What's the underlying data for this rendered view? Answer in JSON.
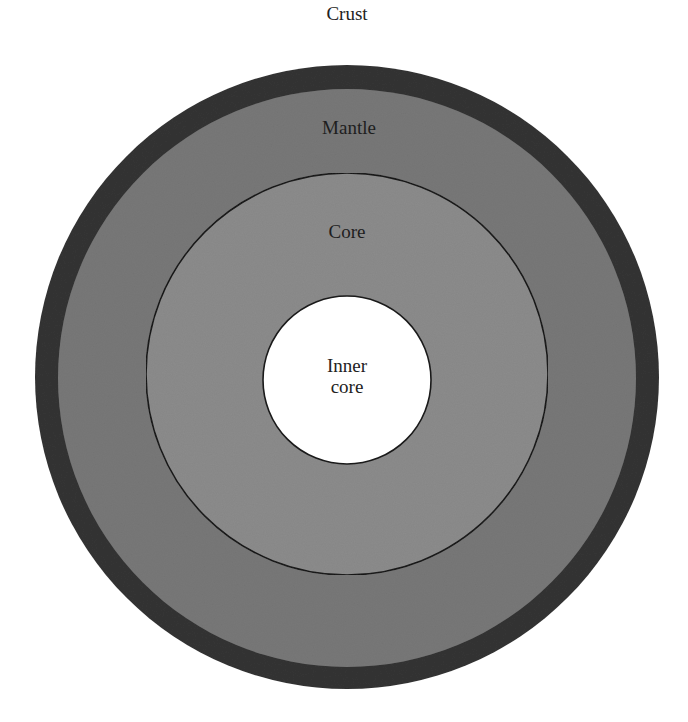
{
  "diagram": {
    "type": "concentric-circles",
    "layers": [
      {
        "id": "crust",
        "label": "Crust",
        "color": "#343434",
        "radius": 312,
        "label_position": "outside-top"
      },
      {
        "id": "mantle",
        "label": "Mantle",
        "color": "#787878",
        "radius": 289,
        "label_position": "top-inside"
      },
      {
        "id": "core",
        "label": "Core",
        "color": "#8c8c8c",
        "radius": 201,
        "label_position": "top-inside",
        "outline": "#1a1a1a"
      },
      {
        "id": "inner-core",
        "label_line1": "Inner",
        "label_line2": "core",
        "color": "#ffffff",
        "radius": 84,
        "label_position": "center",
        "outline": "#1a1a1a"
      }
    ],
    "center": {
      "x": 347,
      "y": 378
    }
  },
  "labels": {
    "crust": "Crust",
    "mantle": "Mantle",
    "core": "Core",
    "inner_core_line1": "Inner",
    "inner_core_line2": "core"
  }
}
